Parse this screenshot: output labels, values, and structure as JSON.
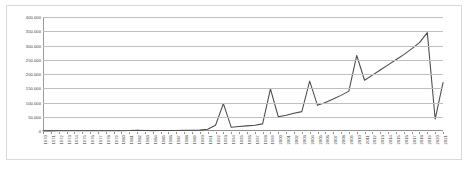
{
  "chart_data": {
    "type": "line",
    "title": "",
    "subtitle": "",
    "xlabel": "",
    "ylabel": "",
    "grid": true,
    "legend": false,
    "legend_position": "none",
    "xlim": [
      1970,
      2021
    ],
    "ylim": [
      0,
      400000
    ],
    "y_ticks": [
      0,
      50000,
      100000,
      150000,
      200000,
      250000,
      300000,
      350000,
      400000
    ],
    "y_tick_labels": [
      "0",
      "50.000",
      "100.000",
      "150.000",
      "200.000",
      "250.000",
      "300.000",
      "350.000",
      "400.000"
    ],
    "series_color": "#4a4a4a",
    "grid_color": "#bfbfbf",
    "categories": [
      "1970",
      "1971",
      "1972",
      "1973",
      "1974",
      "1975",
      "1976",
      "1977",
      "1978",
      "1979",
      "1980",
      "1981",
      "1982",
      "1983",
      "1984",
      "1985",
      "1986",
      "1987",
      "1988",
      "1989",
      "1990",
      "1991",
      "1992",
      "1993",
      "1994",
      "1995",
      "1996",
      "1997",
      "1998",
      "1999",
      "2000",
      "2001",
      "2002",
      "2003",
      "2004",
      "2005",
      "2006",
      "2007",
      "2008",
      "2009",
      "2010",
      "2011",
      "2012",
      "2013",
      "2014",
      "2015",
      "2016",
      "2017",
      "2018",
      "2019",
      "2020",
      "2021"
    ],
    "values": [
      500,
      500,
      600,
      600,
      700,
      700,
      800,
      800,
      900,
      1000,
      1200,
      1500,
      2500,
      1500,
      1400,
      1500,
      1700,
      2000,
      2500,
      2800,
      3000,
      6000,
      20000,
      96000,
      13000,
      16000,
      18000,
      20000,
      25000,
      148000,
      50000,
      55000,
      62000,
      68000,
      175000,
      90000,
      100000,
      112000,
      125000,
      140000,
      265000,
      178000,
      196000,
      214000,
      232000,
      250000,
      268000,
      288000,
      310000,
      345000,
      42000,
      170000
    ]
  }
}
